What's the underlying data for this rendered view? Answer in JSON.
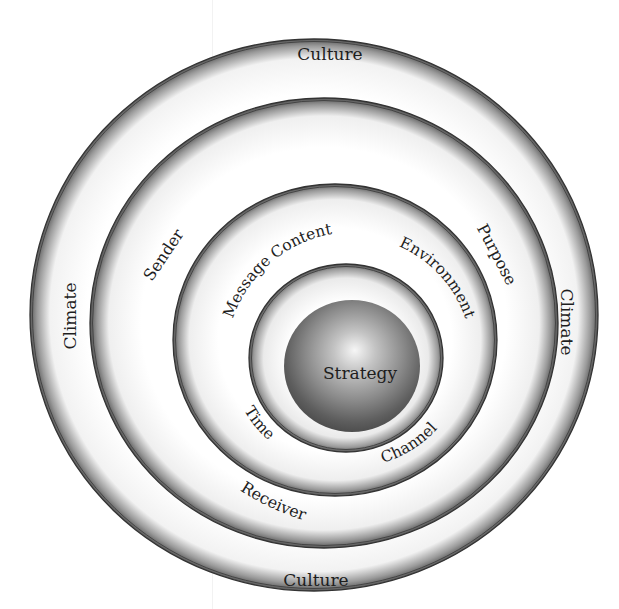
{
  "diagram": {
    "title": "",
    "colors": {
      "background": "#ffffff",
      "ring_line": "#3a3a3a",
      "ring_shadow": "#6a6a6a",
      "sphere_dark": "#4a4a4a",
      "sphere_light": "#f4f4f4",
      "text": "#1e1e1e"
    },
    "rings": [
      {
        "id": "outer",
        "labels": [
          {
            "text": "Culture",
            "position": "top"
          },
          {
            "text": "Culture",
            "position": "bottom"
          },
          {
            "text": "Climate",
            "position": "left"
          },
          {
            "text": "Climate",
            "position": "right"
          }
        ]
      },
      {
        "id": "second",
        "labels": [
          {
            "text": "Sender",
            "position": "upper-left"
          },
          {
            "text": "Purpose",
            "position": "upper-right"
          },
          {
            "text": "Receiver",
            "position": "lower-left"
          }
        ]
      },
      {
        "id": "third",
        "labels": [
          {
            "text": "Message Content",
            "position": "upper-left"
          },
          {
            "text": "Environment",
            "position": "upper-right"
          },
          {
            "text": "Time",
            "position": "lower-left"
          },
          {
            "text": "Channel",
            "position": "lower-right"
          }
        ]
      },
      {
        "id": "core",
        "labels": [
          {
            "text": "Strategy",
            "position": "center"
          }
        ]
      }
    ]
  }
}
